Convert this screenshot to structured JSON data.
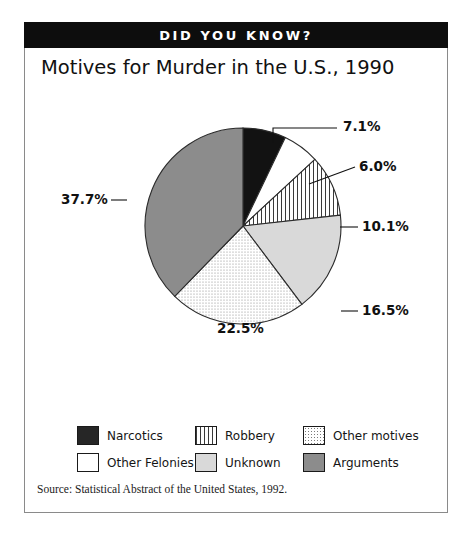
{
  "banner": {
    "text": "DID YOU KNOW?"
  },
  "source": {
    "text": "Source:  Statistical Abstract of the United States, 1992."
  },
  "legend": {
    "items": [
      {
        "label": "Narcotics",
        "swatch": "solid-dark-swatch"
      },
      {
        "label": "Robbery",
        "swatch": "vertical-stripes-swatch"
      },
      {
        "label": "Other motives",
        "swatch": "dotted-swatch"
      },
      {
        "label": "Other Felonies",
        "swatch": "white-swatch"
      },
      {
        "label": "Unknown",
        "swatch": "light-gray-swatch"
      },
      {
        "label": "Arguments",
        "swatch": "mid-gray-swatch"
      }
    ]
  },
  "chart_data": {
    "type": "pie",
    "title": "Motives for Murder in the U.S., 1990",
    "xlabel": "",
    "ylabel": "",
    "legend_position": "bottom",
    "start_angle_deg": 0,
    "direction": "clockwise",
    "categories": [
      "Narcotics",
      "Other Felonies",
      "Robbery",
      "Unknown",
      "Other motives",
      "Arguments"
    ],
    "values": [
      7.1,
      6.0,
      10.1,
      16.5,
      22.5,
      37.7
    ],
    "labels": [
      "7.1%",
      "6.0%",
      "10.1%",
      "16.5%",
      "22.5%",
      "37.7%"
    ],
    "total": 99.9,
    "slices": [
      {
        "name": "Narcotics",
        "value": 7.1,
        "label": "7.1%",
        "fill": "#121212",
        "pattern": "solid",
        "label_placement": "outside",
        "label_x": 318,
        "label_y": 48,
        "leader": "M 248 60 L 248 45 L 312 45"
      },
      {
        "name": "Other Felonies",
        "value": 6.0,
        "label": "6.0%",
        "fill": "#ffffff",
        "pattern": "solid",
        "label_placement": "outside",
        "label_x": 334,
        "label_y": 88,
        "leader": "M 284 101 L 330 84"
      },
      {
        "name": "Robbery",
        "value": 10.1,
        "label": "10.1%",
        "fill": "#ffffff",
        "pattern": "stripes",
        "label_placement": "outside",
        "label_x": 337,
        "label_y": 148,
        "leader": "M 315 144 L 333 144"
      },
      {
        "name": "Unknown",
        "value": 16.5,
        "label": "16.5%",
        "fill": "#d9d9d9",
        "pattern": "solid",
        "label_placement": "outside",
        "label_x": 337,
        "label_y": 232,
        "leader": "M 316 228 L 333 228"
      },
      {
        "name": "Other motives",
        "value": 22.5,
        "label": "22.5%",
        "fill": "#ffffff",
        "pattern": "dots",
        "label_placement": "inside",
        "label_x": 192,
        "label_y": 250,
        "leader": ""
      },
      {
        "name": "Arguments",
        "value": 37.7,
        "label": "37.7%",
        "fill": "#8c8c8c",
        "pattern": "solid",
        "label_placement": "outside",
        "label_x": 36,
        "label_y": 121,
        "leader": "M 86 117 L 102 117"
      }
    ],
    "geometry": {
      "cx": 218,
      "cy": 143,
      "r": 98
    }
  }
}
